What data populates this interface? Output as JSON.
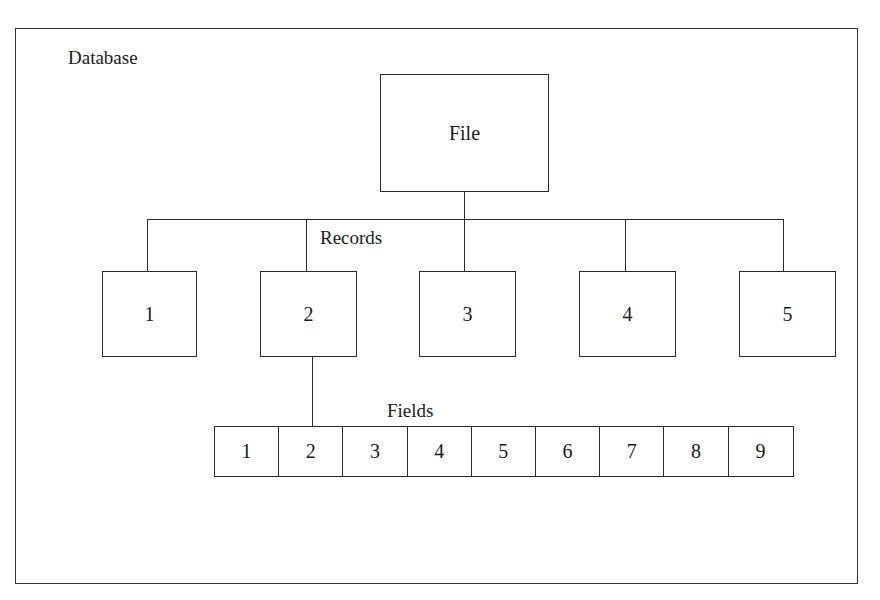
{
  "diagram": {
    "container_label": "Database",
    "root": {
      "label": "File"
    },
    "records_label": "Records",
    "records": [
      {
        "label": "1"
      },
      {
        "label": "2"
      },
      {
        "label": "3"
      },
      {
        "label": "4"
      },
      {
        "label": "5"
      }
    ],
    "fields_label": "Fields",
    "fields": [
      {
        "label": "1"
      },
      {
        "label": "2"
      },
      {
        "label": "3"
      },
      {
        "label": "4"
      },
      {
        "label": "5"
      },
      {
        "label": "6"
      },
      {
        "label": "7"
      },
      {
        "label": "8"
      },
      {
        "label": "9"
      }
    ],
    "expanded_record_index": 1,
    "colors": {
      "line": "#2a2a2a",
      "background": "#ffffff",
      "text": "#1a1a1a"
    }
  }
}
